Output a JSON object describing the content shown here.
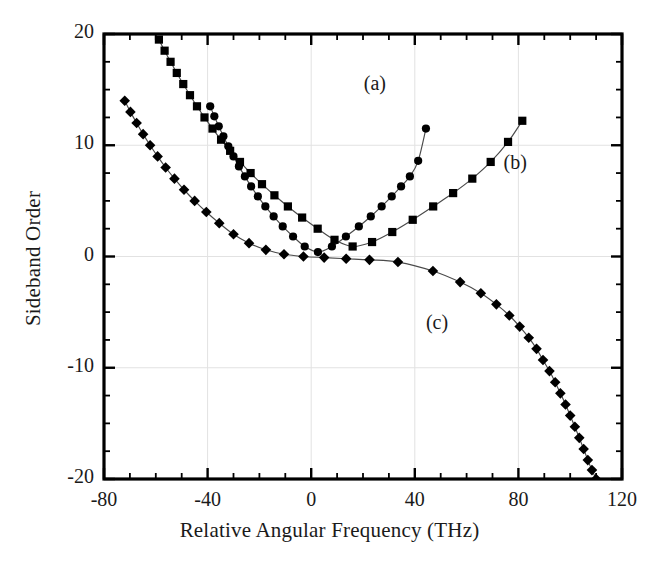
{
  "chart_data": {
    "type": "scatter",
    "title": "",
    "xlabel": "Relative Angular Frequency (THz)",
    "ylabel": "Sideband Order",
    "xlim": [
      -80,
      120
    ],
    "ylim": [
      -20,
      20
    ],
    "xticks": [
      -80,
      -40,
      0,
      40,
      80,
      120
    ],
    "xticklabels": [
      "-80",
      "-40",
      "0",
      "40",
      "80",
      "120"
    ],
    "yticks": [
      20,
      10,
      0,
      -10,
      -20
    ],
    "yticklabels": [
      "20",
      "10",
      "0",
      "-10",
      "-20"
    ],
    "x_minor_step": 10,
    "y_minor_step": 2.5,
    "grid": "faint gridlines at major ticks",
    "legend_position": "inline annotations",
    "annotations": [
      {
        "text": "(a)",
        "x": 28,
        "y": 15.3
      },
      {
        "text": "(b)",
        "x": 82,
        "y": 8.2
      },
      {
        "text": "(c)",
        "x": 52,
        "y": -6.2
      }
    ],
    "series": [
      {
        "name": "(a)",
        "marker": "circle",
        "color": "#000000",
        "x": [
          -39.0,
          -37.4,
          -35.7,
          -33.9,
          -32.0,
          -30.0,
          -27.9,
          -25.6,
          -23.2,
          -20.6,
          -17.7,
          -14.5,
          -11.0,
          -7.0,
          -2.5,
          2.6,
          8.0,
          13.4,
          18.4,
          23.0,
          27.2,
          31.1,
          34.7,
          38.1,
          41.3,
          44.3
        ],
        "y": [
          13.5,
          12.6,
          11.7,
          10.8,
          9.9,
          9.0,
          8.1,
          7.2,
          6.3,
          5.4,
          4.5,
          3.6,
          2.7,
          1.8,
          0.9,
          0.4,
          0.9,
          1.8,
          2.7,
          3.6,
          4.5,
          5.4,
          6.3,
          7.2,
          8.6,
          11.5
        ]
      },
      {
        "name": "(b)",
        "marker": "square",
        "color": "#000000",
        "x": [
          -58.8,
          -56.6,
          -54.3,
          -51.9,
          -49.4,
          -46.8,
          -44.1,
          -41.2,
          -38.1,
          -34.8,
          -31.3,
          -27.5,
          -23.4,
          -19.0,
          -14.2,
          -9.0,
          -3.5,
          2.5,
          9.0,
          16.0,
          23.5,
          31.3,
          39.2,
          47.1,
          54.8,
          62.2,
          69.3,
          76.0,
          81.5
        ],
        "y": [
          19.5,
          18.5,
          17.5,
          16.5,
          15.5,
          14.5,
          13.5,
          12.5,
          11.5,
          10.5,
          9.5,
          8.5,
          7.5,
          6.5,
          5.5,
          4.5,
          3.5,
          2.5,
          1.5,
          0.9,
          1.3,
          2.2,
          3.3,
          4.5,
          5.7,
          7.0,
          8.5,
          10.3,
          12.2
        ]
      },
      {
        "name": "(c)",
        "marker": "diamond",
        "color": "#000000",
        "x": [
          -72.0,
          -69.8,
          -67.4,
          -64.9,
          -62.2,
          -59.3,
          -56.2,
          -52.8,
          -49.1,
          -45.0,
          -40.5,
          -35.5,
          -30.0,
          -24.0,
          -17.5,
          -10.5,
          -3.0,
          5.0,
          13.5,
          22.5,
          33.5,
          47.0,
          57.5,
          65.5,
          71.5,
          76.5,
          80.5,
          84.0,
          87.0,
          89.5,
          92.0,
          94.2,
          96.2,
          98.2,
          100.0,
          101.8,
          103.5,
          105.2,
          106.8,
          108.4,
          110.0
        ],
        "y": [
          14.0,
          13.0,
          12.0,
          11.0,
          10.0,
          9.0,
          8.0,
          7.0,
          6.0,
          5.0,
          4.0,
          3.0,
          2.0,
          1.2,
          0.6,
          0.2,
          0.0,
          -0.1,
          -0.2,
          -0.3,
          -0.5,
          -1.3,
          -2.3,
          -3.3,
          -4.3,
          -5.3,
          -6.3,
          -7.3,
          -8.3,
          -9.3,
          -10.3,
          -11.3,
          -12.3,
          -13.3,
          -14.3,
          -15.3,
          -16.3,
          -17.3,
          -18.3,
          -19.2,
          -20.0
        ]
      }
    ]
  },
  "axis": {
    "x_title": "Relative Angular Frequency (THz)",
    "y_title": "Sideband Order"
  },
  "labels": {
    "a": "(a)",
    "b": "(b)",
    "c": "(c)"
  },
  "colors": {
    "ink": "#000000",
    "grid": "#e2e2e2",
    "curve": "#4a4a4a"
  }
}
